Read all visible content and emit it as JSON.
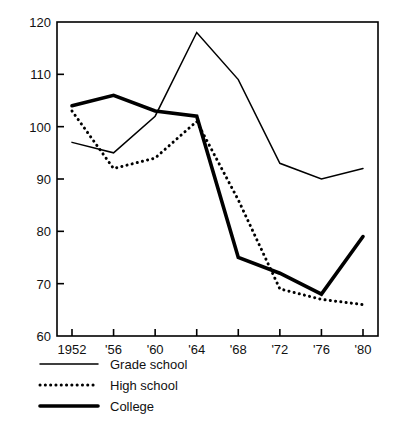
{
  "chart_data": {
    "type": "line",
    "title": "",
    "subtitle": "",
    "xlabel": "",
    "ylabel": "",
    "x": [
      1952,
      1956,
      1960,
      1964,
      1968,
      1972,
      1976,
      1980
    ],
    "categories": [
      "1952",
      "'56",
      "'60",
      "'64",
      "'68",
      "'72",
      "'76",
      "'80"
    ],
    "xtick_labels": [
      "1952",
      "'56",
      "'60",
      "'64",
      "'68",
      "'72",
      "'76",
      "'80"
    ],
    "ytick_labels": [
      "60",
      "70",
      "80",
      "90",
      "100",
      "110",
      "120"
    ],
    "yticks": [
      60,
      70,
      80,
      90,
      100,
      110,
      120
    ],
    "ylim": [
      60,
      120
    ],
    "grid": false,
    "legend_position": "below-axes-left",
    "series": [
      {
        "name": "Grade school",
        "style": "solid-thin",
        "color": "#000000",
        "values": [
          97,
          95,
          102,
          118,
          109,
          93,
          90,
          92
        ]
      },
      {
        "name": "High school",
        "style": "dotted",
        "color": "#000000",
        "values": [
          103,
          92,
          94,
          101,
          86,
          69,
          67,
          66
        ]
      },
      {
        "name": "College",
        "style": "solid-thick",
        "color": "#000000",
        "values": [
          104,
          106,
          103,
          102,
          75,
          72,
          68,
          79
        ]
      }
    ]
  },
  "axis": {
    "y_labels": [
      {
        "value": 120,
        "text": "120"
      },
      {
        "value": 110,
        "text": "110"
      },
      {
        "value": 100,
        "text": "100"
      },
      {
        "value": 90,
        "text": "90"
      },
      {
        "value": 80,
        "text": "80"
      },
      {
        "value": 70,
        "text": "70"
      },
      {
        "value": 60,
        "text": "60"
      }
    ],
    "x_labels": [
      {
        "value": 1952,
        "text": "1952"
      },
      {
        "value": 1956,
        "text": "'56"
      },
      {
        "value": 1960,
        "text": "'60"
      },
      {
        "value": 1964,
        "text": "'64"
      },
      {
        "value": 1968,
        "text": "'68"
      },
      {
        "value": 1972,
        "text": "'72"
      },
      {
        "value": 1976,
        "text": "'76"
      },
      {
        "value": 1980,
        "text": "'80"
      }
    ]
  },
  "legend": {
    "items": [
      {
        "label": "Grade school",
        "style": "solid-thin"
      },
      {
        "label": "High school",
        "style": "dotted"
      },
      {
        "label": "College",
        "style": "solid-thick"
      }
    ]
  }
}
